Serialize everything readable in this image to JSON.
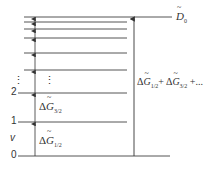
{
  "diagram": {
    "type": "vibrational energy level diagram",
    "axis_label": "v",
    "level_labels": [
      "0",
      "1",
      "2"
    ],
    "ellipsis": "⋮",
    "dissociation_label": {
      "symbol": "D",
      "subscript": "0"
    },
    "spacing_labels": [
      {
        "prefix": "Δ",
        "symbol": "G",
        "subscript": "1/2"
      },
      {
        "prefix": "Δ",
        "symbol": "G",
        "subscript": "3/2"
      }
    ],
    "sum_label": {
      "term1": {
        "prefix": "Δ",
        "symbol": "G",
        "subscript": "1/2"
      },
      "plus": "+",
      "term2": {
        "prefix": "Δ",
        "symbol": "G",
        "subscript": "3/2"
      },
      "tail": "+..."
    },
    "levels_y": [
      156,
      122,
      93,
      70,
      53,
      38,
      29,
      22,
      17
    ],
    "colors": {
      "line": "#555555",
      "arrow": "#333333"
    }
  }
}
